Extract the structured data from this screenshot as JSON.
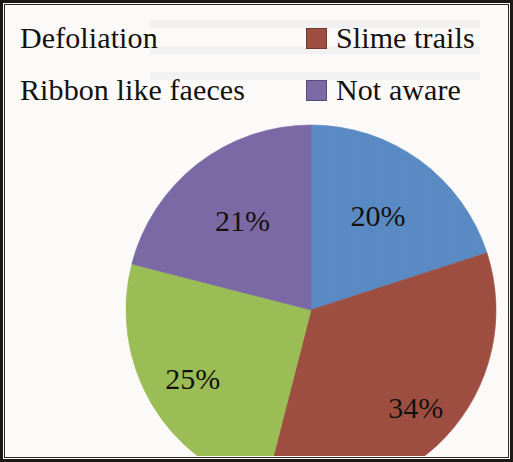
{
  "frame": {
    "background_color": "#fcfbf9",
    "border_color": "#1c1a18"
  },
  "legend": {
    "rows": [
      {
        "left": {
          "label": "Defoliation",
          "color": "#5B8BC4",
          "swatch_visible": false
        },
        "right": {
          "label": "Slime trails",
          "color": "#9E4F42",
          "swatch_visible": true
        }
      },
      {
        "left": {
          "label": "Ribbon like faeces",
          "color": "#9CBE56",
          "swatch_visible": false
        },
        "right": {
          "label": "Not aware",
          "color": "#7B6AA5",
          "swatch_visible": true
        }
      }
    ]
  },
  "chart_data": {
    "type": "pie",
    "title": "",
    "subtitle": "",
    "xlabel": "",
    "ylabel": "",
    "grid": false,
    "legend_position": "top",
    "start_angle_deg": 0,
    "direction": "clockwise",
    "value_unit": "%",
    "categories": [
      "Defoliation",
      "Slime trails",
      "Ribbon like faeces",
      "Not aware"
    ],
    "values": [
      20,
      34,
      25,
      21
    ],
    "labels": [
      "20%",
      "34%",
      "25%",
      "21%"
    ],
    "colors": [
      "#5B8BC4",
      "#9E4F42",
      "#9CBE56",
      "#7B6AA5"
    ],
    "slices": [
      {
        "name": "Defoliation",
        "value": 20,
        "label": "20%",
        "color": "#5B8BC4"
      },
      {
        "name": "Slime trails",
        "value": 34,
        "label": "34%",
        "color": "#9E4F42"
      },
      {
        "name": "Ribbon like faeces",
        "value": 25,
        "label": "25%",
        "color": "#9CBE56"
      },
      {
        "name": "Not aware",
        "value": 21,
        "label": "21%",
        "color": "#7B6AA5"
      }
    ],
    "total": 100
  }
}
